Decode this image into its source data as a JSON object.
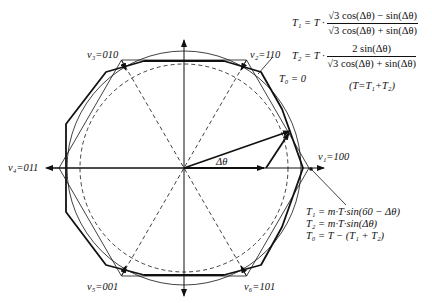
{
  "diagram": {
    "vectors": [
      {
        "name": "v1",
        "state": "100",
        "label": "v₁=100"
      },
      {
        "name": "v2",
        "state": "110",
        "label": "v₂=110"
      },
      {
        "name": "v3",
        "state": "010",
        "label": "v₃=010"
      },
      {
        "name": "v4",
        "state": "011",
        "label": "v₄=011"
      },
      {
        "name": "v5",
        "state": "001",
        "label": "v₅=001"
      },
      {
        "name": "v6",
        "state": "101",
        "label": "v₆=101"
      }
    ],
    "angle_label": "Δθ",
    "t0_callout": "T₀ = 0",
    "top_equations": {
      "t1_lhs": "T₁ = T ·",
      "t1_num": "√3 cos(Δθ) − sin(Δθ)",
      "t1_den": "√3 cos(Δθ) + sin(Δθ)",
      "t2_lhs": "T₂ = T ·",
      "t2_num": "2 sin(Δθ)",
      "t2_den": "√3 cos(Δθ) + sin(Δθ)",
      "sum_note": "(T=T₁+T₂)"
    },
    "bottom_equations": [
      "T₁ = m·T·sin(60 − Δθ)",
      "T₂ = m·T·sin(Δθ)",
      "T₀ = T − (T₁ + T₂)"
    ]
  }
}
